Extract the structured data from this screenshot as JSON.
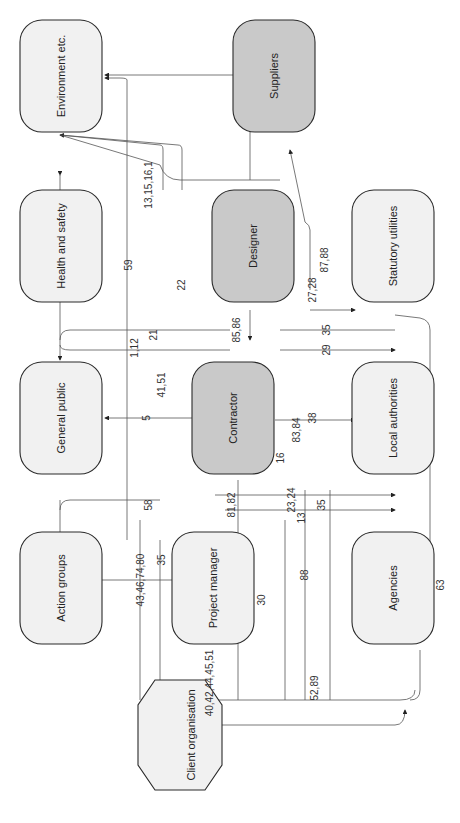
{
  "diagram": {
    "orientation": "rotated-90-ccw",
    "nodes": [
      {
        "id": "environment",
        "label": "Environment etc.",
        "style": "light"
      },
      {
        "id": "suppliers",
        "label": "Suppliers",
        "style": "dark"
      },
      {
        "id": "health_safety",
        "label": "Health and safety",
        "style": "light"
      },
      {
        "id": "designer",
        "label": "Designer",
        "style": "dark"
      },
      {
        "id": "statutory_utilities",
        "label": "Statutory utilities",
        "style": "light"
      },
      {
        "id": "general_public",
        "label": "General public",
        "style": "light"
      },
      {
        "id": "contractor",
        "label": "Contractor",
        "style": "dark"
      },
      {
        "id": "local_authorities",
        "label": "Local authorities",
        "style": "light"
      },
      {
        "id": "action_groups",
        "label": "Action groups",
        "style": "light"
      },
      {
        "id": "project_manager",
        "label": "Project manager",
        "style": "light"
      },
      {
        "id": "agencies",
        "label": "Agencies",
        "style": "light"
      },
      {
        "id": "client_organisation",
        "label": "Client organisation",
        "style": "light"
      }
    ],
    "edge_labels": [
      "59",
      "13,15,16,1",
      "22",
      "21",
      "1,12",
      "41,51",
      "5",
      "85,86",
      "27,28",
      "87,88",
      "35",
      "29",
      "16",
      "83,84",
      "38",
      "58",
      "81,82",
      "23,24",
      "13",
      "35",
      "88",
      "30",
      "43,46,74,80",
      "35",
      "40,42,44,45,51",
      "52,89",
      "63"
    ]
  }
}
